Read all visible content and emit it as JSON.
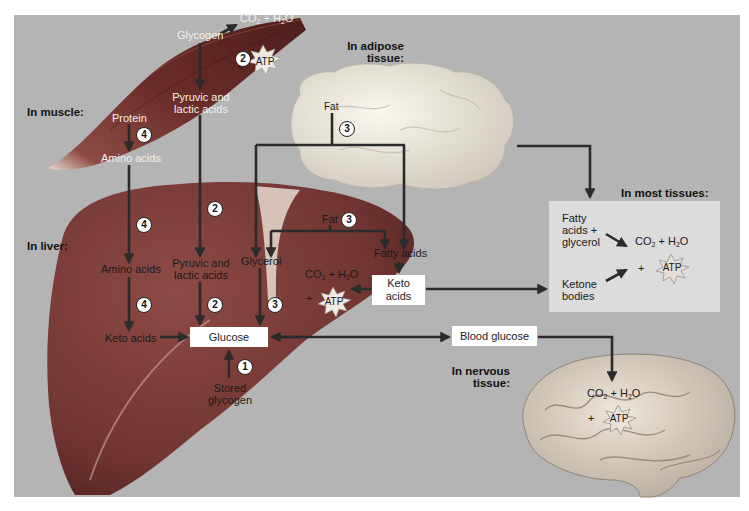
{
  "colors": {
    "background": "#b4b4b4",
    "muscle": "#6e2f2c",
    "liver": "#7a3d3a",
    "adipose": "#ece7dc",
    "brain": "#d9cfc2",
    "arrow": "#2b2b2b",
    "most_tissues_box": "#dcdcdc",
    "label_box": "#ffffff"
  },
  "regions": {
    "muscle": "In muscle:",
    "adipose": [
      "In adipose",
      "tissue:"
    ],
    "liver": "In liver:",
    "most_tissues": "In most tissues:",
    "nervous": [
      "In nervous",
      "tissue:"
    ]
  },
  "muscle": {
    "glycogen": "Glycogen",
    "products": "CO2 + H2O",
    "plus": "+",
    "atp": "ATP",
    "pyruvic": [
      "Pyruvic and",
      "lactic acids"
    ],
    "protein": "Protein",
    "amino_acids": "Amino acids",
    "step_glycogen": "2",
    "step_protein": "4"
  },
  "adipose": {
    "fat": "Fat",
    "step": "3"
  },
  "liver": {
    "amino_acids": "Amino acids",
    "pyruvic": [
      "Pyruvic and",
      "lactic acids"
    ],
    "glycerol": "Glycerol",
    "fat": "Fat",
    "fat_step": "3",
    "fatty_acids": "Fatty acids",
    "products": "CO2 + H2O",
    "plus": "+",
    "atp": "ATP",
    "keto_acids_box": [
      "Keto",
      "acids"
    ],
    "keto_acids": "Keto acids",
    "glucose": "Glucose",
    "stored_glycogen": [
      "Stored",
      "glycogen"
    ],
    "step_pyruvic_in": "2",
    "step_amino_in": "4",
    "step_amino_keto": "4",
    "step_pyruvic_glucose": "2",
    "step_glycerol_glucose": "3",
    "step_glycogen_glucose": "1"
  },
  "blood": {
    "glucose": "Blood glucose"
  },
  "most_tissues": {
    "fatty_acids": [
      "Fatty",
      "acids +",
      "glycerol"
    ],
    "ketone": [
      "Ketone",
      "bodies"
    ],
    "products": "CO2 + H2O",
    "plus": "+",
    "atp": "ATP"
  },
  "nervous": {
    "products": "CO2 + H2O",
    "plus": "+",
    "atp": "ATP"
  }
}
